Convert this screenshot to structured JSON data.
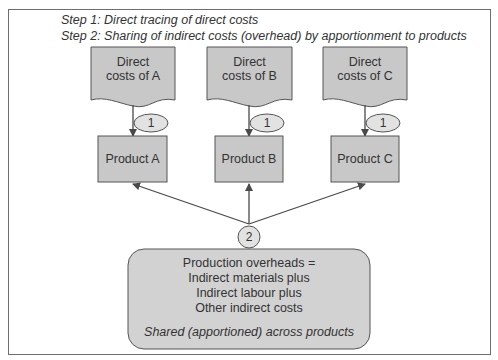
{
  "header": {
    "step1": "Step 1: Direct tracing of direct costs",
    "step2": "Step 2: Sharing of indirect costs (overhead) by apportionment to products"
  },
  "direct_costs": [
    {
      "line1": "Direct",
      "line2": "costs of A"
    },
    {
      "line1": "Direct",
      "line2": "costs of B"
    },
    {
      "line1": "Direct",
      "line2": "costs of C"
    }
  ],
  "step_markers": {
    "direct": "1",
    "overhead": "2"
  },
  "products": [
    {
      "label": "Product A"
    },
    {
      "label": "Product B"
    },
    {
      "label": "Product C"
    }
  ],
  "overheads": {
    "lines": [
      "Production overheads =",
      "Indirect materials plus",
      "Indirect labour plus",
      "Other indirect costs"
    ],
    "note": "Shared (apportioned) across products"
  },
  "colors": {
    "box_fill": "#c8c8c8",
    "overhead_fill": "#d2d2d2",
    "stroke": "#555555",
    "frame": "#6e6e6e"
  }
}
